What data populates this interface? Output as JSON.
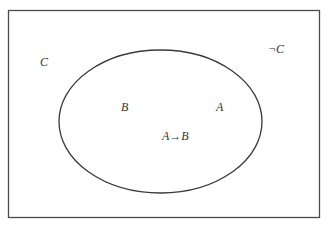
{
  "diagram": {
    "type": "venn",
    "universe": {
      "label": "C",
      "complement_label": "¬C",
      "stroke_color": "#4a4a4a"
    },
    "ellipse": {
      "label_left": "B",
      "label_right": "A",
      "label_center": "A→B",
      "stroke_color": "#3a3a3a"
    }
  }
}
